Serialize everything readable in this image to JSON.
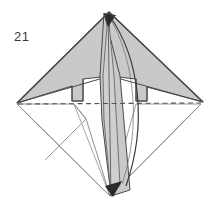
{
  "figure": {
    "step_label": "21",
    "caption": "",
    "type": "origami-fold-diagram",
    "width": 218,
    "height": 207
  },
  "colors": {
    "background": "#ffffff",
    "paper_shaded": "#c9c9c9",
    "paper_shaded_light": "#d4d4d4",
    "paper_white": "#ffffff",
    "edge_dark": "#3a3a3a",
    "edge_medium": "#6e6e6e",
    "edge_light": "#9a9a9a",
    "fold_dashed": "#555555",
    "arrow_fill": "#2b2b2b",
    "label_text": "#3b3b3b"
  },
  "geometry": {
    "vertices": {
      "top": "109,12",
      "bottom": "110,196",
      "left": "16,103",
      "right": "203,102",
      "center": "110,76"
    },
    "dashed_fold_line": {
      "from": "18,104",
      "to": "201,103",
      "style": "dashed",
      "label": "valley-fold-line"
    }
  },
  "shapes": {
    "upper_left_flap": {
      "name": "upper-left-shaded-flap",
      "fill": "shaded",
      "points": "109,12 110,76 82,79 82,100 72,101 72,85 17,103"
    },
    "upper_right_flap": {
      "name": "upper-right-shaded-flap",
      "fill": "shaded",
      "points": "109,12 203,102 146,86 146,101 136,100 136,79 110,76"
    },
    "center_spike": {
      "name": "center-shaded-spike",
      "fill": "shaded",
      "points": "109,13 120,76 129,190 110,196 103,120 101,76"
    },
    "lower_left_white": {
      "name": "lower-left-white-panel",
      "fill": "white",
      "points": "17,104 72,104 85,118 110,196"
    },
    "lower_right_white": {
      "name": "lower-right-white-panel",
      "fill": "white",
      "points": "201,104 136,104 110,196"
    }
  },
  "arrows": [
    {
      "name": "top-fold-arrow",
      "direction": "downward-curl",
      "tip_at": "109,14"
    },
    {
      "name": "bottom-fold-arrow",
      "direction": "upward-curl",
      "tip_at": "112,195"
    }
  ]
}
